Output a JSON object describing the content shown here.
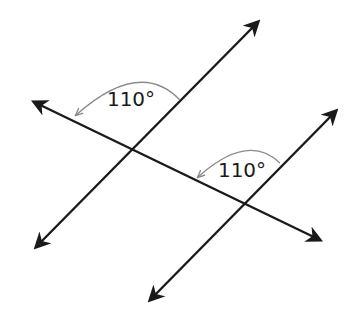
{
  "diagram": {
    "type": "parallel-lines-with-transversal",
    "colors": {
      "line": "#1a1a1a",
      "arc": "#8a8a8a",
      "background": "#ffffff"
    },
    "lines": [
      {
        "name": "parallel-line-1",
        "from": [
          36,
          247
        ],
        "to": [
          258,
          22
        ]
      },
      {
        "name": "parallel-line-2",
        "from": [
          150,
          300
        ],
        "to": [
          336,
          111
        ]
      },
      {
        "name": "transversal",
        "from": [
          34,
          102
        ],
        "to": [
          320,
          240
        ]
      }
    ],
    "intersections": [
      {
        "name": "intersection-1",
        "point": [
          133,
          151
        ]
      },
      {
        "name": "intersection-2",
        "point": [
          245,
          205
        ]
      }
    ],
    "angles": [
      {
        "label": "110°",
        "value": 110,
        "unit": "degrees",
        "label_pos": [
          131,
          106
        ]
      },
      {
        "label": "110°",
        "value": 110,
        "unit": "degrees",
        "label_pos": [
          242,
          177
        ]
      }
    ]
  }
}
